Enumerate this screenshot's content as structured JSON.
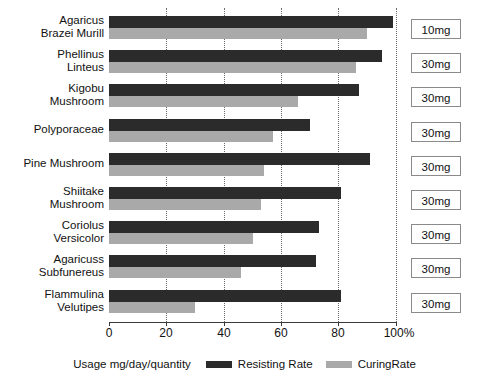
{
  "chart_data": {
    "type": "bar",
    "orientation": "horizontal",
    "title": "",
    "xlabel": "",
    "ylabel": "",
    "xlim": [
      0,
      100
    ],
    "xticks": [
      "0",
      "20",
      "40",
      "60",
      "80",
      "100%"
    ],
    "xtick_values": [
      0,
      20,
      40,
      60,
      80,
      100
    ],
    "grid": "vertical dotted gridlines at 20, 40, 60, 80, 100",
    "legend_position": "bottom-center",
    "categories": [
      "Agaricus\nBrazei Murill",
      "Phellinus\nLinteus",
      "Kigobu\nMushroom",
      "Polyporaceae",
      "Pine Mushroom",
      "Shiitake\nMushroom",
      "Coriolus\nVersicolor",
      "Agaricuss\nSubfunereus",
      "Flammulina\nVelutipes"
    ],
    "series": [
      {
        "name": "Resisting Rate",
        "color": "#2b2b2b",
        "values": [
          99,
          95,
          87,
          70,
          91,
          81,
          73,
          72,
          81
        ]
      },
      {
        "name": "CuringRate",
        "color": "#a9a9a9",
        "values": [
          90,
          86,
          66,
          57,
          54,
          53,
          50,
          46,
          30
        ]
      }
    ],
    "annotations": {
      "label": "Usage mg/day/quantity",
      "values": [
        "10mg",
        "30mg",
        "30mg",
        "30mg",
        "30mg",
        "30mg",
        "30mg",
        "30mg",
        "30mg"
      ]
    }
  },
  "legend": {
    "usage_label": "Usage mg/day/quantity",
    "entries": [
      {
        "label": "Resisting Rate",
        "swatch": "resist"
      },
      {
        "label": "CuringRate",
        "swatch": "cure"
      }
    ]
  }
}
